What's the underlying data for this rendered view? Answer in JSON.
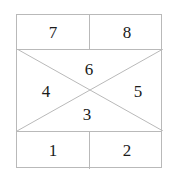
{
  "diagram": {
    "colors": {
      "background": "#ffffff",
      "line": "#b9b9b9",
      "text": "#1b1b1b"
    },
    "bands": {
      "top": {
        "cells": [
          {
            "id": "cell-7",
            "label": "7"
          },
          {
            "id": "cell-8",
            "label": "8"
          }
        ]
      },
      "middle": {
        "shape": "x-crossed-rectangle",
        "regions": [
          {
            "id": "region-6",
            "position": "top",
            "label": "6"
          },
          {
            "id": "region-4",
            "position": "left",
            "label": "4"
          },
          {
            "id": "region-5",
            "position": "right",
            "label": "5"
          },
          {
            "id": "region-3",
            "position": "bottom",
            "label": "3"
          }
        ]
      },
      "bottom": {
        "cells": [
          {
            "id": "cell-1",
            "label": "1"
          },
          {
            "id": "cell-2",
            "label": "2"
          }
        ]
      }
    }
  }
}
